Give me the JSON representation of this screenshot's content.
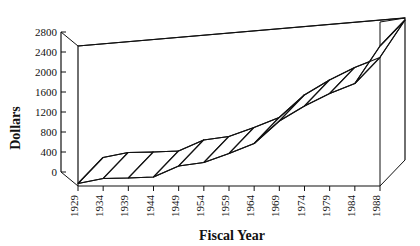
{
  "chart_data": {
    "type": "area",
    "title": "",
    "xlabel": "Fiscal Year",
    "ylabel": "Dollars",
    "categories": [
      "1929",
      "1934",
      "1939",
      "1944",
      "1949",
      "1954",
      "1959",
      "1964",
      "1969",
      "1974",
      "1979",
      "1984",
      "1988"
    ],
    "values": [
      50,
      150,
      160,
      180,
      400,
      470,
      650,
      850,
      1300,
      1600,
      1850,
      2050,
      2800
    ],
    "ylim": [
      0,
      2800
    ],
    "yticks": [
      0,
      400,
      800,
      1200,
      1600,
      2000,
      2400,
      2800
    ],
    "ytick_labels": [
      "0",
      "400",
      "800",
      "1200",
      "1600",
      "2000",
      "2400",
      "2800"
    ],
    "xtick_rotation": -90,
    "grid": false,
    "legend": false,
    "legend_position": "none",
    "three_d": true,
    "series": [
      {
        "name": "Dollars",
        "values": [
          50,
          150,
          160,
          180,
          400,
          470,
          650,
          850,
          1300,
          1600,
          1850,
          2050,
          2800
        ]
      }
    ]
  },
  "axes": {
    "y_title": "Dollars",
    "x_title": "Fiscal Year"
  },
  "colors": {
    "ink": "#111111",
    "plot_background": "#ffffff",
    "ribbon_fill": "#ffffff",
    "ribbon_stroke": "#111111"
  },
  "ghost_top_fragments": [
    "",
    "",
    ""
  ]
}
